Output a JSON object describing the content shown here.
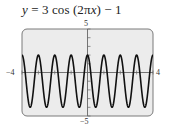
{
  "chart_data": {
    "type": "line",
    "title": "y = 3 cos (2πx) − 1",
    "title_parts": {
      "lhs": "y",
      "rest": " = 3 cos (2π",
      "var_x": "x",
      "tail": ") − 1"
    },
    "function": "y = 3*cos(2*pi*x) - 1",
    "xlabel": "",
    "ylabel": "",
    "xlim": [
      -4,
      4
    ],
    "ylim": [
      -5,
      5
    ],
    "x_tick_labels": {
      "min": "−4",
      "max": "4"
    },
    "y_tick_labels": {
      "min": "−5",
      "max": "5"
    },
    "x_ticks": [
      -4,
      -3,
      -2,
      -1,
      0,
      1,
      2,
      3,
      4
    ],
    "y_ticks": [
      -5,
      -4,
      -3,
      -2,
      -1,
      0,
      1,
      2,
      3,
      4,
      5
    ],
    "grid": false,
    "legend": null,
    "series": [
      {
        "name": "y = 3 cos (2πx) − 1",
        "amplitude": 3,
        "period": 1,
        "vertical_shift": -1,
        "max": 2,
        "min": -4,
        "sample_points": [
          {
            "x": -4,
            "y": 2
          },
          {
            "x": -3.5,
            "y": -4
          },
          {
            "x": -3,
            "y": 2
          },
          {
            "x": -2.5,
            "y": -4
          },
          {
            "x": -2,
            "y": 2
          },
          {
            "x": -1.5,
            "y": -4
          },
          {
            "x": -1,
            "y": 2
          },
          {
            "x": -0.5,
            "y": -4
          },
          {
            "x": 0,
            "y": 2
          },
          {
            "x": 0.5,
            "y": -4
          },
          {
            "x": 1,
            "y": 2
          },
          {
            "x": 1.5,
            "y": -4
          },
          {
            "x": 2,
            "y": 2
          },
          {
            "x": 2.5,
            "y": -4
          },
          {
            "x": 3,
            "y": 2
          },
          {
            "x": 3.5,
            "y": -4
          },
          {
            "x": 4,
            "y": 2
          }
        ]
      }
    ]
  },
  "style": {
    "plot_bg": "#ececec",
    "frame_color": "#7a7a7a",
    "axis_color": "#666666",
    "curve_color": "#111111"
  }
}
